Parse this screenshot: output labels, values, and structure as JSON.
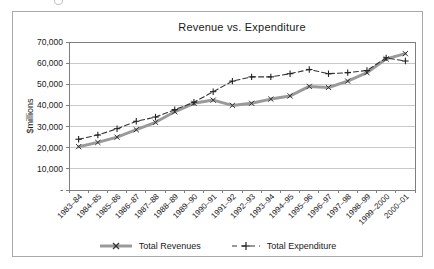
{
  "figure": {
    "background": "#ffffff",
    "frame_border_color": "#a9a9a9"
  },
  "chart_data": {
    "type": "line",
    "title": "Revenue vs. Expenditure",
    "xlabel": "",
    "ylabel": "$millions",
    "ylim": [
      0,
      70000
    ],
    "ytick_interval": 10000,
    "ytick_labels": [
      "-",
      "10,000",
      "20,000",
      "30,000",
      "40,000",
      "50,000",
      "60,000",
      "70,000"
    ],
    "grid": true,
    "legend_position": "bottom",
    "categories": [
      "1983–84",
      "1984–85",
      "1985–86",
      "1986–87",
      "1987–88",
      "1988–89",
      "1989–90",
      "1990–91",
      "1991–92",
      "1992–93",
      "1993–94",
      "1994–95",
      "1995–96",
      "1996–97",
      "1997–98",
      "1998–99",
      "1999–2000",
      "2000–01"
    ],
    "series": [
      {
        "name": "Total Revenues",
        "marker": "x",
        "line_style": "solid-thick",
        "color": "#9a9a9a",
        "marker_color": "#333333",
        "values": [
          20500,
          22500,
          25000,
          28500,
          32000,
          37000,
          41000,
          42500,
          40000,
          41000,
          43000,
          44500,
          49000,
          48500,
          51500,
          55500,
          62000,
          64500
        ]
      },
      {
        "name": "Total Expenditure",
        "marker": "+",
        "line_style": "dashed",
        "color": "#333333",
        "marker_color": "#222222",
        "values": [
          24000,
          26000,
          29000,
          32500,
          34500,
          38000,
          41500,
          46500,
          51500,
          53500,
          53500,
          55000,
          57000,
          55000,
          55500,
          56500,
          62500,
          61000
        ]
      }
    ],
    "colors": {
      "gridline": "#c9c9c9",
      "axis": "#7f7f7f",
      "tick_text": "#1a1a1a"
    }
  }
}
